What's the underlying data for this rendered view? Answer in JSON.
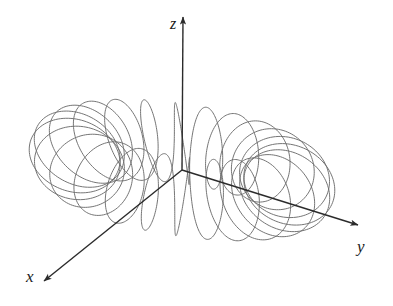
{
  "figure": {
    "background_color": "#ffffff",
    "width": 393,
    "height": 306
  },
  "axes": {
    "origin": {
      "x": 182,
      "y": 170
    },
    "line_color": "#2b2b2b",
    "line_width": 1.4,
    "items": [
      {
        "name": "x",
        "label": "x",
        "label_x": 26,
        "label_y": 282,
        "tip_x": 44,
        "tip_y": 281,
        "direction_deg": 218,
        "arrow": "arrowhead-filled"
      },
      {
        "name": "y",
        "label": "y",
        "label_x": 357,
        "label_y": 252,
        "tip_x": 358,
        "tip_y": 225,
        "direction_deg": 17,
        "arrow": "arrowhead-filled"
      },
      {
        "name": "z",
        "label": "z",
        "label_x": 170,
        "label_y": 29,
        "tip_x": 183,
        "tip_y": 17,
        "direction_deg": 270,
        "arrow": "arrowhead-filled"
      }
    ]
  },
  "chart_data": {
    "type": "line",
    "xlabel": "x",
    "ylabel": "y",
    "zlabel": "z",
    "grid": false,
    "legend": false,
    "curve": {
      "name": "toroidal-spiral",
      "equation": "x = (R + r cos(n t)) cos(t),  y = (R + r cos(n t)) sin(t),  z = r sin(n t)",
      "stroke_color": "#6e6e6e",
      "stroke_width": 0.95,
      "torus_major_radius_R": 1.0,
      "torus_minor_radius_r": 0.42,
      "windings_n": 24,
      "t_start": 0.0,
      "t_end": 6.2831853,
      "samples": 2600
    },
    "projection": {
      "type": "oblique-3d",
      "scale": 104,
      "x_axis_screen_dx": -0.78,
      "x_axis_screen_dy": 0.62,
      "y_axis_screen_dx": 1.0,
      "y_axis_screen_dy": 0.2,
      "z_axis_screen_dx": 0.0,
      "z_axis_screen_dy": -1.0,
      "z_scale": 148
    },
    "axis_extents": {
      "x_from": [
        0,
        0,
        0
      ],
      "x_to": [
        1.28,
        0,
        0
      ],
      "y_from": [
        0,
        0,
        0
      ],
      "y_to": [
        1.72,
        0,
        0
      ],
      "z_from": [
        0,
        0,
        0
      ],
      "z_to": [
        0,
        0,
        1.03
      ]
    }
  }
}
